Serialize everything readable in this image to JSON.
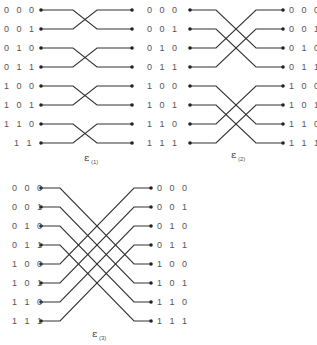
{
  "colors": {
    "wire": "#333333",
    "label": "#555555",
    "background": "#ffffff"
  },
  "panels": [
    {
      "id": "e1",
      "caption": "ε",
      "subscript": "(1)",
      "bit_exchanged": 0,
      "left_labels": [
        "0 0 0",
        "0 0 1",
        "0 1 0",
        "0 1 1",
        "1 0 0",
        "1 0 1",
        "1 1 0",
        "1 1"
      ],
      "right_labels": [],
      "mapping": [
        1,
        0,
        3,
        2,
        5,
        4,
        7,
        6
      ],
      "geom": {
        "y0": 10,
        "dy": 19,
        "lx": 41,
        "rx": 132,
        "bendL": 73,
        "bendR": 97,
        "labelLX": 4,
        "labelRX": 0,
        "capX": 84,
        "capY": 161
      }
    },
    {
      "id": "e2",
      "caption": "ε",
      "subscript": "(2)",
      "bit_exchanged": 1,
      "left_labels": [
        "0 0 0",
        "0 0 1",
        "0 1 0",
        "0 1 1",
        "1 0 0",
        "1 0 1",
        "1 1 0",
        "1 1 1"
      ],
      "right_labels": [
        "0 0 0",
        "0 0 1",
        "0 1 0",
        "0 1 1",
        "1 0 0",
        "1 0 1",
        "1 1 0",
        "1 1 1"
      ],
      "mapping": [
        2,
        3,
        0,
        1,
        6,
        7,
        4,
        5
      ],
      "geom": {
        "y0": 10,
        "dy": 19,
        "lx": 190,
        "rx": 283,
        "bendL": 216,
        "bendR": 256,
        "labelLX": 147,
        "labelRX": 289,
        "capX": 231,
        "capY": 158
      }
    },
    {
      "id": "e3",
      "caption": "ε",
      "subscript": "(3)",
      "bit_exchanged": 2,
      "left_labels": [
        "0 0 0",
        "0 0 1",
        "0 1 0",
        "0 1 1",
        "1 0 0",
        "1 0 1",
        "1 1 0",
        "1 1 1"
      ],
      "right_labels": [
        "0 0 0",
        "0 0 1",
        "0 1 0",
        "0 1 1",
        "1 0 0",
        "1 0 1",
        "1 1 0",
        "1 1 1"
      ],
      "mapping": [
        4,
        5,
        6,
        7,
        0,
        1,
        2,
        3
      ],
      "geom": {
        "y0": 188,
        "dy": 19,
        "lx": 41,
        "rx": 151,
        "bendL": 60,
        "bendR": 134,
        "labelLX": 12,
        "labelRX": 157,
        "capX": 92,
        "capY": 337
      }
    }
  ]
}
